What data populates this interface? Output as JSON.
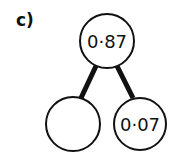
{
  "question": {
    "label": "c)"
  },
  "diagram": {
    "type": "part-whole",
    "whole": {
      "value": "0·87"
    },
    "parts": [
      {
        "value": ""
      },
      {
        "value": "0·07"
      }
    ]
  }
}
